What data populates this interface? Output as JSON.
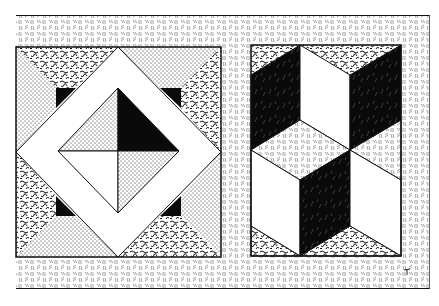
{
  "image": {
    "description": "Two quilt block illustrations in black-and-white stippled/hatched engraving style on a textured border",
    "width": 439,
    "height": 306
  },
  "colors": {
    "background": "#ffffff",
    "ink": "#0a0a0a",
    "paper": "#ffffff"
  },
  "textures": {
    "border": "dash-hatch",
    "dotted": "stipple",
    "squiggle": "vermicular",
    "solid": "black",
    "plain": "white"
  },
  "frame": {
    "x": 16,
    "y": 15,
    "width": 414,
    "height": 274
  },
  "blocks": [
    {
      "name": "square-in-square-block",
      "x": 16,
      "y": 47,
      "width": 205,
      "height": 210,
      "center_quadrants": [
        "dotted",
        "black",
        "white",
        "dotted"
      ],
      "corner_textures": [
        "squiggle",
        "dotted",
        "squiggle",
        "dotted"
      ]
    },
    {
      "name": "tumbling-blocks-block",
      "x": 251,
      "y": 45,
      "width": 150,
      "height": 211,
      "faces": [
        "black",
        "white",
        "black",
        "border",
        "white",
        "black",
        "white",
        "squiggle"
      ]
    }
  ],
  "mark": {
    "text": "",
    "position": "bottom-right"
  }
}
